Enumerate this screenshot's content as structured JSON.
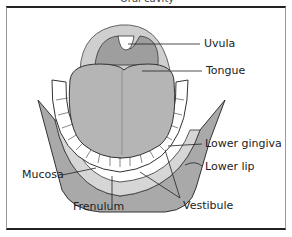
{
  "diagram": {
    "title_cut": "Oral cavity",
    "labels": {
      "uvula": "Uvula",
      "tongue": "Tongue",
      "lower_gingiva": "Lower gingiva",
      "lower_lip": "Lower lip",
      "mucosa": "Mucosa",
      "frenulum": "Frenulum",
      "vestibule": "Vestibule"
    },
    "colors": {
      "tongue": "#b5b5b5",
      "palate": "#c8c8c8",
      "lip": "#a9a9a9",
      "gingiva": "#d6d6d6",
      "teeth": "#ffffff",
      "outline": "#333333"
    }
  }
}
